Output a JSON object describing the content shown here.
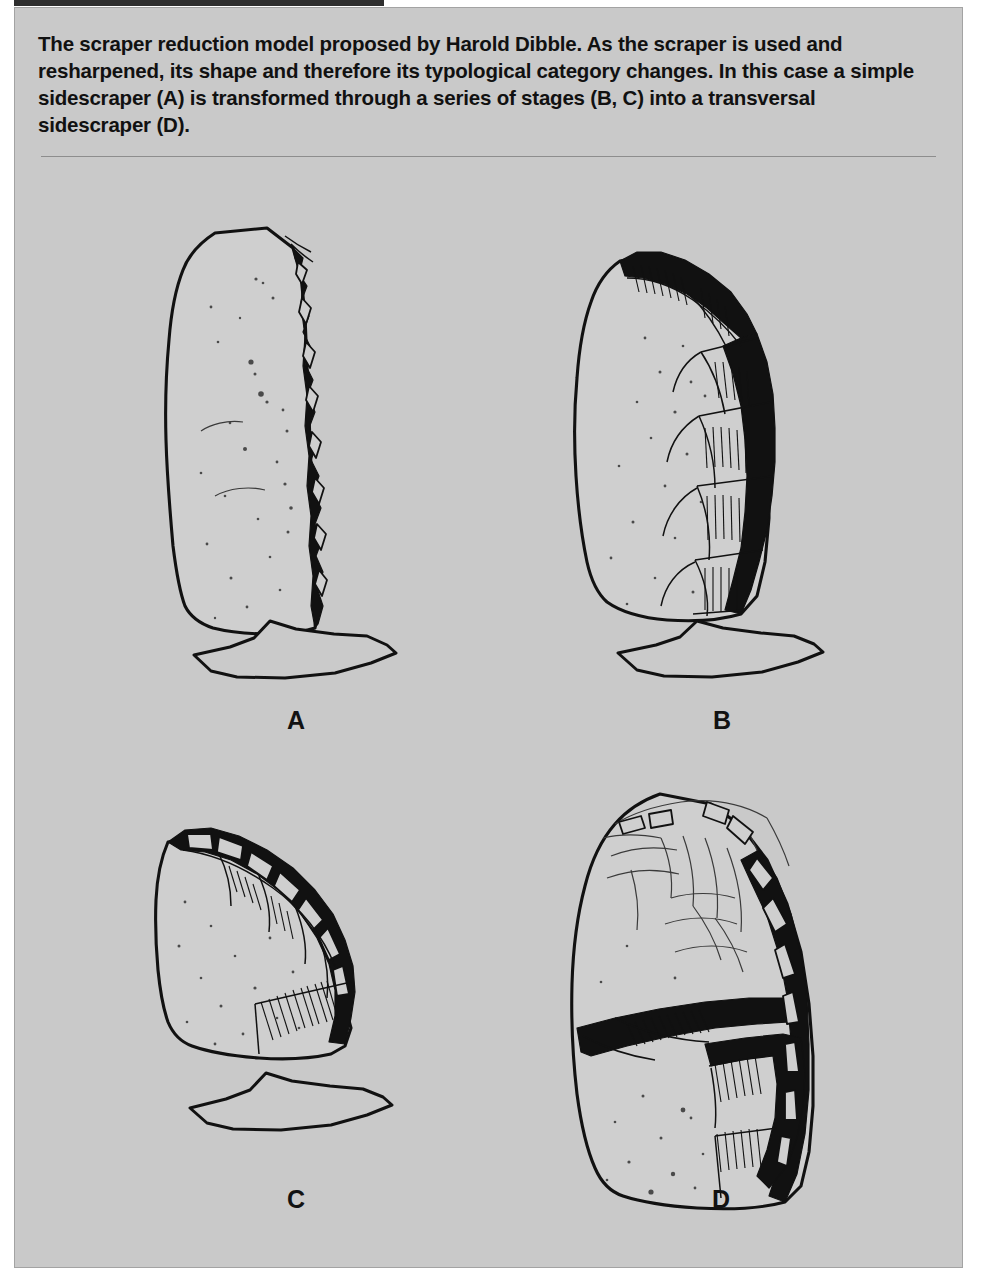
{
  "figure": {
    "heading_sliver_text": "FIGURE 2.7",
    "caption": "The scraper reduction model proposed by Harold Dibble. As the scraper is used and resharpened, its shape and therefore its typological category changes. In this case a simple sidescraper (A) is transformed through a series of stages (B, C) into a transversal sidescraper (D).",
    "panel_background_color": "#c9c9c9",
    "ink_color": "#111111",
    "rule_color": "#8d8d8d"
  },
  "specimens": [
    {
      "id": "a",
      "label": "A",
      "name": "simple-sidescraper",
      "description": "Tall oval flake, unmodified except for retouch along the right lateral edge",
      "has_cross_section": true,
      "position": "top-left"
    },
    {
      "id": "b",
      "label": "B",
      "name": "reduction-stage-b",
      "description": "Same flake after resharpening; retouch extends around upper and right margins",
      "has_cross_section": true,
      "position": "top-right"
    },
    {
      "id": "c",
      "label": "C",
      "name": "reduction-stage-c",
      "description": "Further reduced; blank is shorter and the retouched edge runs diagonally",
      "has_cross_section": true,
      "position": "bottom-left"
    },
    {
      "id": "d",
      "label": "D",
      "name": "transversal-sidescraper",
      "description": "Final form; retouch forms a transverse working edge across the piece",
      "has_cross_section": false,
      "position": "bottom-right"
    }
  ]
}
